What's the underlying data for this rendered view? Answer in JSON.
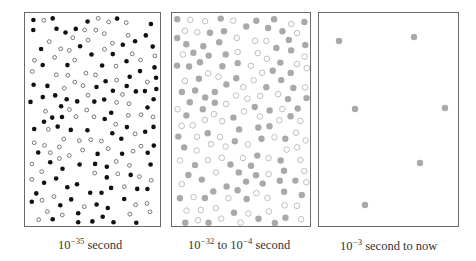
{
  "figure": {
    "panels": [
      {
        "id": "panel-1",
        "caption": {
          "base": "10",
          "exp": "−35",
          "rest": " second"
        },
        "box": {
          "x": 24,
          "y": 12,
          "w": 137,
          "h": 215
        },
        "particle_style": {
          "filled_color": "#111111",
          "hollow_color": "#6a6a6a"
        },
        "particles": {
          "kind": "mixed-dense",
          "count": 175,
          "seed": 7,
          "filled_ratio": 0.5,
          "radius": 2.3
        }
      },
      {
        "id": "panel-2",
        "caption": {
          "base": "10",
          "exp": "−32",
          "mid": " to 10",
          "exp2": "−4",
          "rest": " second"
        },
        "box": {
          "x": 171,
          "y": 12,
          "w": 140,
          "h": 215
        },
        "particle_style": {
          "filled_color": "#a9a9a9",
          "hollow_color": "#b8b8b8"
        },
        "particles": {
          "kind": "mixed-dense",
          "count": 165,
          "seed": 21,
          "filled_ratio": 0.5,
          "radius": 3.2
        }
      },
      {
        "id": "panel-3",
        "caption": {
          "base": "10",
          "exp": "−3",
          "rest": " second to now"
        },
        "box": {
          "x": 318,
          "y": 12,
          "w": 141,
          "h": 215
        },
        "particle_style": {
          "filled_color": "#a9a9a9",
          "hollow_color": "#a9a9a9"
        },
        "particles": {
          "kind": "sparse",
          "radius": 3.2,
          "points": [
            [
              20,
              28
            ],
            [
              95,
              24
            ],
            [
              36,
              96
            ],
            [
              126,
              95
            ],
            [
              101,
              150
            ],
            [
              46,
              192
            ]
          ]
        }
      }
    ]
  }
}
